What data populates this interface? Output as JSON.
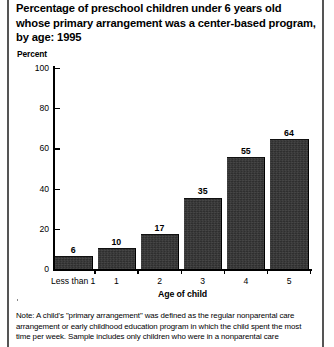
{
  "title": "Percentage of preschool children under 6 years old whose primary arrangement was a center-based program, by age: 1995",
  "axis_unit_label": "Percent",
  "xaxis_title": "Age of child",
  "note": "Note: A child's \"primary arrangement\" was defined as the regular nonparental care arrangement or early childhood education program in which the child spent the most time per week. Sample includes only children who were in a nonparental care",
  "colors": {
    "bar": "#2f2f2f",
    "axis": "#000000",
    "rule": "#555555",
    "text": "#000000"
  },
  "chart_data": {
    "type": "bar",
    "title": "Percentage of preschool children under 6 years old whose primary arrangement was a center-based program, by age: 1995",
    "xlabel": "Age of child",
    "ylabel": "Percent",
    "categories": [
      "Less than 1",
      "1",
      "2",
      "3",
      "4",
      "5"
    ],
    "values": [
      6,
      10,
      17,
      35,
      55,
      64
    ],
    "value_labels": [
      "6",
      "10",
      "17",
      "35",
      "55",
      "64"
    ],
    "ylim": [
      0,
      100
    ],
    "yticks": [
      0,
      20,
      40,
      60,
      80,
      100
    ],
    "ytick_labels": [
      "0",
      "20",
      "40",
      "60",
      "80",
      "100"
    ],
    "grid": false,
    "legend": false,
    "series": [
      {
        "name": "Center-based program",
        "values": [
          6,
          10,
          17,
          35,
          55,
          64
        ]
      }
    ]
  }
}
